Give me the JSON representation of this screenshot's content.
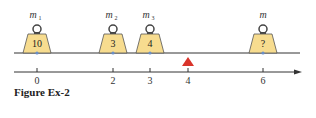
{
  "figure": {
    "caption": "Figure Ex-2",
    "beam_color": "#333333",
    "weight_fill": "#f7dc8f",
    "fulcrum_color": "#d9342b",
    "weights": [
      {
        "label": "m",
        "sub": "1",
        "value": "10",
        "x": 37
      },
      {
        "label": "m",
        "sub": "2",
        "value": "3",
        "x": 113
      },
      {
        "label": "m",
        "sub": "3",
        "value": "4",
        "x": 150
      },
      {
        "label": "m",
        "sub": "",
        "value": "?",
        "x": 263
      }
    ],
    "fulcrum_position": "4",
    "axis_ticks": [
      "0",
      "2",
      "3",
      "4",
      "6"
    ]
  }
}
